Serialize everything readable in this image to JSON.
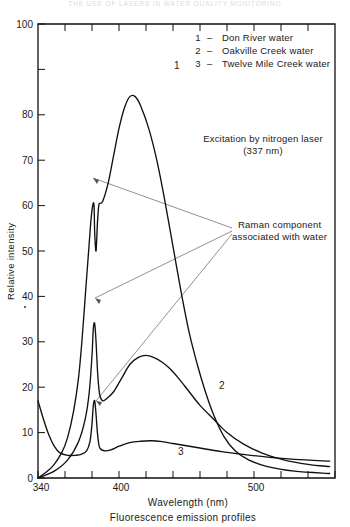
{
  "figure": {
    "scan_bleed_text": "THE USE OF LASERS IN WATER QUALITY MONITORING",
    "caption": "Fluorescence emission profiles"
  },
  "annotations": {
    "excitation_line1": "Excitation by nitrogen laser",
    "excitation_line2": "(337 nm)",
    "raman_line1": "Raman component",
    "raman_line2": "associated with water"
  },
  "legend": {
    "entries": [
      {
        "key": "1",
        "dash": "–",
        "label": "Don  River  water"
      },
      {
        "key": "2",
        "dash": "–",
        "label": "Oakville  Creek  water"
      },
      {
        "key": "3",
        "dash": "–",
        "label": "Twelve  Mile  Creek  water"
      }
    ]
  },
  "curve_labels": {
    "one": "1",
    "two": "2",
    "three": "3"
  },
  "chart_data": {
    "type": "line",
    "title": "Fluorescence emission profiles",
    "xlabel": "Wavelength  (nm)",
    "ylabel": "Relative  intensity",
    "xlim": [
      340,
      560
    ],
    "ylim": [
      0,
      100
    ],
    "grid": false,
    "legend_position": "top-right",
    "x_tick_values": [
      340,
      360,
      380,
      400,
      420,
      440,
      460,
      480,
      500,
      520,
      540,
      560
    ],
    "x_tick_labels": [
      "340",
      "",
      "",
      "400",
      "",
      "",
      "",
      "",
      "500",
      "",
      "",
      ""
    ],
    "y_tick_values": [
      0,
      10,
      20,
      30,
      40,
      50,
      60,
      70,
      80,
      90,
      100
    ],
    "y_tick_labels": [
      "0",
      "10",
      "20",
      "30",
      "40",
      "50",
      "60",
      "70",
      "80",
      "",
      "100"
    ],
    "series": [
      {
        "name": "Don River water",
        "key": "1",
        "points": [
          [
            340,
            0
          ],
          [
            352,
            3
          ],
          [
            362,
            9
          ],
          [
            370,
            22
          ],
          [
            376,
            44
          ],
          [
            379,
            56
          ],
          [
            380.5,
            60
          ],
          [
            381.5,
            60
          ],
          [
            382,
            54
          ],
          [
            383,
            50
          ],
          [
            384,
            56
          ],
          [
            385,
            60
          ],
          [
            386,
            60.5
          ],
          [
            388,
            61
          ],
          [
            392,
            65
          ],
          [
            396,
            71
          ],
          [
            400,
            77
          ],
          [
            404,
            81.5
          ],
          [
            408,
            84
          ],
          [
            412,
            84
          ],
          [
            416,
            82
          ],
          [
            422,
            77
          ],
          [
            428,
            70
          ],
          [
            434,
            61
          ],
          [
            440,
            51
          ],
          [
            446,
            41
          ],
          [
            452,
            32
          ],
          [
            458,
            25
          ],
          [
            464,
            19
          ],
          [
            470,
            14
          ],
          [
            478,
            9
          ],
          [
            486,
            6
          ],
          [
            496,
            4
          ],
          [
            510,
            2.5
          ],
          [
            530,
            1.5
          ],
          [
            556,
            1
          ]
        ]
      },
      {
        "name": "Oakville Creek water",
        "key": "2",
        "points": [
          [
            340,
            0
          ],
          [
            352,
            1.5
          ],
          [
            362,
            4
          ],
          [
            370,
            8
          ],
          [
            375,
            13
          ],
          [
            378,
            19
          ],
          [
            380,
            27
          ],
          [
            381,
            33
          ],
          [
            382,
            34
          ],
          [
            383,
            30
          ],
          [
            384,
            24
          ],
          [
            385,
            20
          ],
          [
            386,
            18
          ],
          [
            388,
            17
          ],
          [
            391,
            17.5
          ],
          [
            396,
            19
          ],
          [
            402,
            22
          ],
          [
            408,
            25
          ],
          [
            414,
            26.5
          ],
          [
            420,
            27
          ],
          [
            426,
            26.5
          ],
          [
            432,
            25.5
          ],
          [
            438,
            24
          ],
          [
            444,
            22
          ],
          [
            452,
            19
          ],
          [
            460,
            16
          ],
          [
            470,
            13
          ],
          [
            480,
            10
          ],
          [
            492,
            7.5
          ],
          [
            506,
            5.5
          ],
          [
            522,
            4
          ],
          [
            540,
            3
          ],
          [
            556,
            2.5
          ]
        ]
      },
      {
        "name": "Twelve Mile Creek water",
        "key": "3",
        "points": [
          [
            340,
            17
          ],
          [
            344,
            13
          ],
          [
            348,
            9.5
          ],
          [
            352,
            7
          ],
          [
            356,
            5.6
          ],
          [
            362,
            5
          ],
          [
            368,
            5
          ],
          [
            372,
            5.2
          ],
          [
            376,
            6
          ],
          [
            378.5,
            8
          ],
          [
            380,
            12
          ],
          [
            381,
            16
          ],
          [
            382,
            17
          ],
          [
            383,
            14
          ],
          [
            384,
            10
          ],
          [
            385,
            7.5
          ],
          [
            386,
            6.5
          ],
          [
            389,
            6
          ],
          [
            394,
            6.2
          ],
          [
            400,
            7
          ],
          [
            408,
            7.8
          ],
          [
            416,
            8.1
          ],
          [
            424,
            8.2
          ],
          [
            432,
            8
          ],
          [
            440,
            7.6
          ],
          [
            450,
            7.1
          ],
          [
            462,
            6.5
          ],
          [
            476,
            5.8
          ],
          [
            492,
            5.2
          ],
          [
            510,
            4.6
          ],
          [
            530,
            4.1
          ],
          [
            556,
            3.7
          ]
        ]
      }
    ],
    "annotations": [
      {
        "text": "Raman component associated with water",
        "targets": [
          [
            381,
            58
          ],
          [
            382,
            34
          ],
          [
            382,
            17
          ]
        ]
      },
      {
        "text": "Excitation by nitrogen laser (337 nm)",
        "targets": []
      }
    ]
  }
}
